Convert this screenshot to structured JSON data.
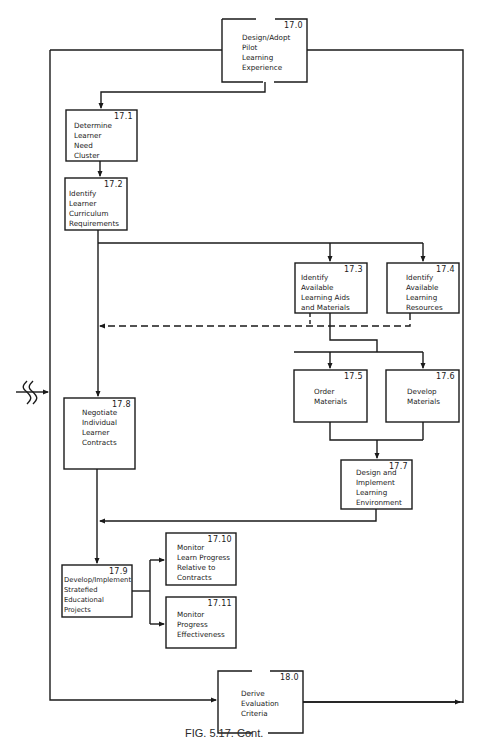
{
  "figure": {
    "caption": "FIG. 5.17. Cont.",
    "connector_symbol": "off-page-connector-break-icon"
  },
  "boxes": [
    {
      "id": "17.0",
      "num": "17.0",
      "label": "Design/Adopt\nPilot\nLearning\nExperience"
    },
    {
      "id": "17.1",
      "num": "17.1",
      "label": "Determine\nLearner\nNeed\nCluster"
    },
    {
      "id": "17.2",
      "num": "17.2",
      "label": "Identify\nLearner\nCurriculum\nRequirements"
    },
    {
      "id": "17.3",
      "num": "17.3",
      "label": "Identify\nAvailable\nLearning Aids\nand Materials"
    },
    {
      "id": "17.4",
      "num": "17.4",
      "label": "Identify\nAvailable\nLearning\nResources"
    },
    {
      "id": "17.5",
      "num": "17.5",
      "label": "Order\nMaterials"
    },
    {
      "id": "17.6",
      "num": "17.6",
      "label": "Develop\nMaterials"
    },
    {
      "id": "17.7",
      "num": "17.7",
      "label": "Design and\nImplement\nLearning\nEnvironment"
    },
    {
      "id": "17.8",
      "num": "17.8",
      "label": "Negotiate\nIndividual\nLearner\nContracts"
    },
    {
      "id": "17.9",
      "num": "17.9",
      "label": "Develop/Implement\nStratefied\nEducational\nProjects"
    },
    {
      "id": "17.10",
      "num": "17.10",
      "label": "Monitor\nLearn Progress\nRelative to\nContracts"
    },
    {
      "id": "17.11",
      "num": "17.11",
      "label": "Monitor\nProgress\nEffectiveness"
    },
    {
      "id": "18.0",
      "num": "18.0",
      "label": "Derive\nEvaluation\nCriteria"
    }
  ],
  "colors": {
    "line": "#1a1a1a",
    "background": "#ffffff"
  }
}
